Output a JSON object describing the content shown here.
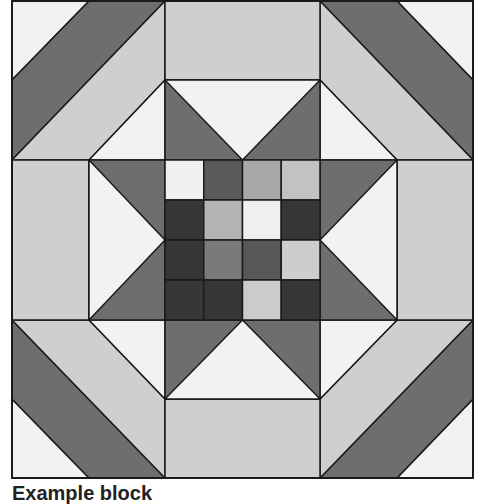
{
  "diagram": {
    "type": "quilt-block",
    "colors": {
      "white": "#f2f2f2",
      "light": "#cfcfcf",
      "medium": "#6e6e6e",
      "outline": "#1a1a1a"
    },
    "center_grid": {
      "rows": 4,
      "cols": 4,
      "cells": [
        [
          "#f0f0f0",
          "#5a5a5a",
          "#a8a8a8",
          "#c2c2c2"
        ],
        [
          "#363636",
          "#b4b4b4",
          "#efefef",
          "#363636"
        ],
        [
          "#363636",
          "#7a7a7a",
          "#585858",
          "#cdcdcd"
        ],
        [
          "#363636",
          "#363636",
          "#cbcbcb",
          "#363636"
        ]
      ]
    }
  },
  "caption": {
    "text": "Example block"
  }
}
